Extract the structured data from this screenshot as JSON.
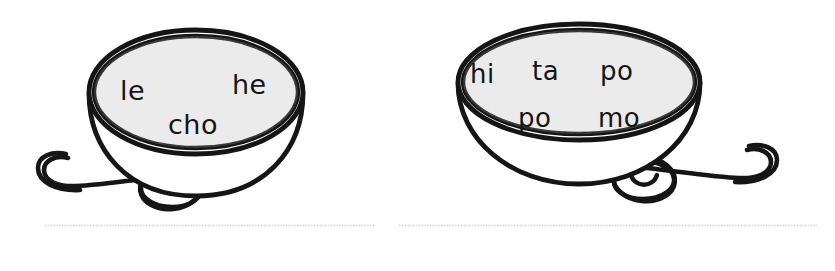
{
  "worksheet": {
    "title": "Syllable Bowls",
    "ink_color": "#151515",
    "bowl_fill_color": "#e9e9e9",
    "paper_color": "#ffffff",
    "writing_line_color": "#cfcfcf"
  },
  "exercises": [
    {
      "id": "exercise-1",
      "name": "leche",
      "bowl_style": "tall-round",
      "spoon_side": "left",
      "syllable_rows": [
        {
          "syllables": [
            "le",
            "he"
          ]
        },
        {
          "syllables": [
            "cho"
          ]
        }
      ],
      "syllables": [
        {
          "text": "le",
          "x": 120,
          "y": 100
        },
        {
          "text": "he",
          "x": 232,
          "y": 94
        },
        {
          "text": "cho",
          "x": 168,
          "y": 134
        }
      ],
      "writing_line": {
        "present": true
      }
    },
    {
      "id": "exercise-2",
      "name": "hipopotamo",
      "bowl_style": "wide-shallow",
      "spoon_side": "right",
      "syllable_rows": [
        {
          "syllables": [
            "hi",
            "ta",
            "po"
          ]
        },
        {
          "syllables": [
            "po",
            "mo"
          ]
        }
      ],
      "syllables": [
        {
          "text": "hi",
          "x": 53,
          "y": 83
        },
        {
          "text": "ta",
          "x": 115,
          "y": 80
        },
        {
          "text": "po",
          "x": 183,
          "y": 80
        },
        {
          "text": "po",
          "x": 101,
          "y": 127
        },
        {
          "text": "mo",
          "x": 181,
          "y": 127
        }
      ],
      "writing_line": {
        "present": true
      }
    }
  ]
}
